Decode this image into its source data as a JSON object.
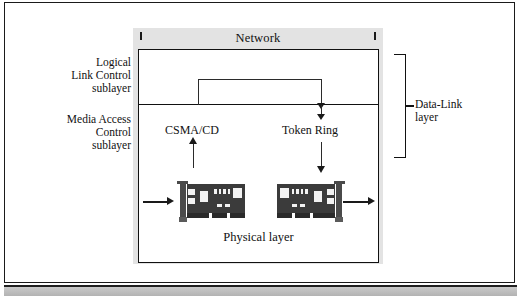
{
  "figure": {
    "network_band_label": "Network",
    "physical_layer_label": "Physical layer",
    "side_labels": {
      "llc": "Logical\nLink Control\nsublayer",
      "mac": "Media Access\nControl\nsublayer"
    },
    "protocols": {
      "csma": "CSMA/CD",
      "token_ring": "Token Ring"
    },
    "bracket_label": "Data-Link\nlayer",
    "colors": {
      "backdrop": "#e3e3e3",
      "band": "#e3e3e3",
      "line": "#111111",
      "card_board": "#3b3b3b",
      "card_chip": "#f2f2f2",
      "page": "#ffffff",
      "bottom_bar": "#b3b3b3"
    },
    "icons": {
      "nic_left": "network-interface-card-icon",
      "nic_right": "network-interface-card-icon",
      "flow_in": "arrow-right-icon",
      "flow_out": "arrow-right-icon",
      "csma_up": "arrow-up-icon",
      "token_down": "arrow-down-icon"
    }
  }
}
